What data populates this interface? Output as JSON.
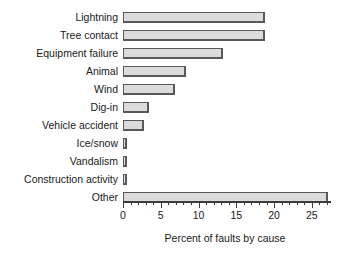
{
  "chart_data": {
    "type": "bar",
    "orientation": "horizontal",
    "title": "",
    "xlabel": "Percent of faults by cause",
    "ylabel": "",
    "xlim": [
      0,
      27.4
    ],
    "grid": false,
    "legend": null,
    "xticks": [
      0,
      5,
      10,
      15,
      20,
      25
    ],
    "xtick_labels": [
      "0",
      "5",
      "10",
      "15",
      "20",
      "25"
    ],
    "minor_tick_step": 1,
    "categories": [
      "Lightning",
      "Tree contact",
      "Equipment failure",
      "Animal",
      "Wind",
      "Dig-in",
      "Vehicle accident",
      "Ice/snow",
      "Vandalism",
      "Construction activity",
      "Other"
    ],
    "values": [
      18.8,
      18.8,
      13.2,
      8.4,
      6.9,
      3.4,
      2.8,
      0.5,
      0.5,
      0.5,
      27.1
    ],
    "bar_fill_color": "#dcdcdc",
    "bar_edge_color": "#59595b",
    "background_color": "#ffffff"
  }
}
